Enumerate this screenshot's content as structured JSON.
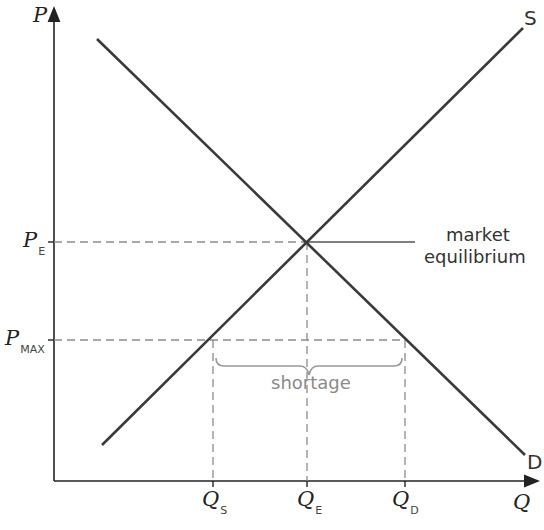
{
  "axes": {
    "y_label": "P",
    "x_label": "Q"
  },
  "curves": {
    "supply_label": "S",
    "demand_label": "D"
  },
  "price_labels": {
    "pe_main": "P",
    "pe_sub": "E",
    "pmax_main": "P",
    "pmax_sub": "MAX"
  },
  "quantity_labels": {
    "qs_main": "Q",
    "qs_sub": "S",
    "qe_main": "Q",
    "qe_sub": "E",
    "qd_main": "Q",
    "qd_sub": "D"
  },
  "annotations": {
    "eq_line1": "market",
    "eq_line2": "equilibrium",
    "shortage": "shortage"
  },
  "colors": {
    "curve": "#3a3a3a",
    "dashed": "#8c8c8c",
    "brace": "#999999"
  }
}
